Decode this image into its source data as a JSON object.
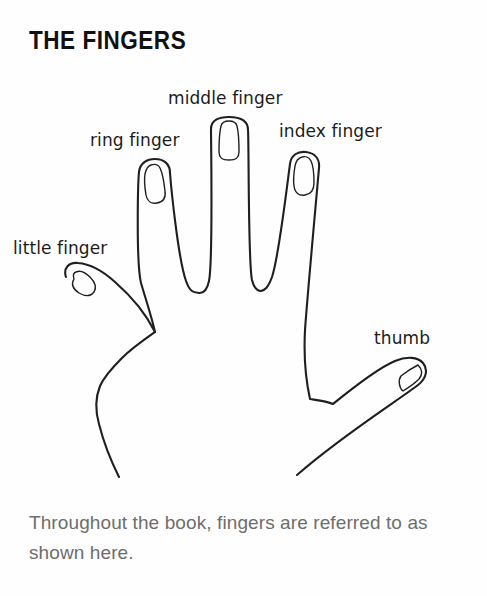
{
  "page": {
    "title": "THE FINGERS",
    "background_color": "#fefefe",
    "ink_color": "#1b1b1b",
    "caption_color": "#6d6d6d"
  },
  "illustration": {
    "name": "open-left-hand-line-drawing",
    "description": "Line drawing of an open left hand, palm facing viewer, with five labeled digits",
    "stroke_color": "#1f1f1f",
    "fill_color": "#ffffff",
    "labels": [
      {
        "id": "middle",
        "text": "middle finger"
      },
      {
        "id": "ring",
        "text": "ring finger"
      },
      {
        "id": "index",
        "text": "index finger"
      },
      {
        "id": "little",
        "text": "little finger"
      },
      {
        "id": "thumb",
        "text": "thumb"
      }
    ]
  },
  "caption": {
    "text": "Throughout the book, fingers are referred to as shown here."
  }
}
